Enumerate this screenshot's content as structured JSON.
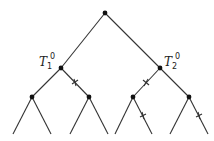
{
  "diagram": {
    "type": "binary-tree",
    "labels": {
      "t1": {
        "base": "T",
        "sub": "1",
        "sup": "0"
      },
      "t2": {
        "base": "T",
        "sub": "2",
        "sup": "0"
      }
    },
    "nodes": [
      {
        "id": "root",
        "x": 105,
        "y": 13
      },
      {
        "id": "t1",
        "x": 61,
        "y": 68
      },
      {
        "id": "t2",
        "x": 160,
        "y": 68
      },
      {
        "id": "a",
        "x": 32,
        "y": 97
      },
      {
        "id": "b",
        "x": 89,
        "y": 97
      },
      {
        "id": "c",
        "x": 133,
        "y": 97
      },
      {
        "id": "d",
        "x": 189,
        "y": 97
      }
    ],
    "edges_marked_with_cross": [
      "t1-b",
      "t2-c",
      "c-leaf4",
      "d-leaf8"
    ]
  }
}
